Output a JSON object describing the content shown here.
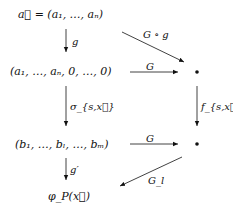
{
  "diagram": {
    "nodes": {
      "start": "a⃗ = (a₁, …, aₙ)",
      "padded": "(a₁, …, aₙ, 0, …, 0)",
      "bullet_top": "•",
      "permuted": "(b₁, …, bₗ, …, bₘ)",
      "bullet_bottom": "•",
      "result": "φ_P(x⃗)"
    },
    "edges": [
      {
        "from": "start",
        "to": "padded",
        "label": "g"
      },
      {
        "from": "start",
        "to": "bullet_top",
        "label": "G ∘ g"
      },
      {
        "from": "padded",
        "to": "bullet_top",
        "label": "G"
      },
      {
        "from": "padded",
        "to": "permuted",
        "label": "σ_{s,x⃗}"
      },
      {
        "from": "bullet_top",
        "to": "bullet_bottom",
        "label": "f_{s,x⃗}"
      },
      {
        "from": "permuted",
        "to": "bullet_bottom",
        "label": "G"
      },
      {
        "from": "permuted",
        "to": "result",
        "label": "g′"
      },
      {
        "from": "bullet_bottom",
        "to": "result",
        "label": "G_l"
      }
    ]
  }
}
